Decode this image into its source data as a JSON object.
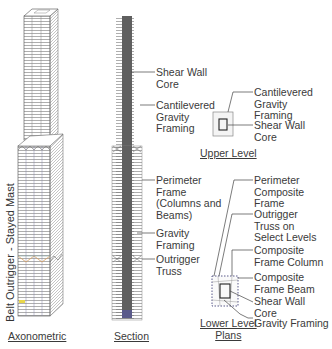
{
  "axonometric": {
    "caption": "Axonometric",
    "vertical_label": "Belt Outrigger - Stayed Mast"
  },
  "section": {
    "caption": "Section",
    "labels": {
      "shear_wall_core": "Shear Wall\nCore",
      "cantilevered_gravity": "Cantilevered\nGravity\nFraming",
      "perimeter_frame": "Perimeter\nFrame\n(Columns and\nBeams)",
      "gravity_framing": "Gravity\nFraming",
      "outrigger_truss": "Outrigger\nTruss"
    }
  },
  "upper_level": {
    "caption": "Upper Level",
    "labels": {
      "cantilevered_gravity": "Cantilevered\nGravity\nFraming",
      "shear_wall_core": "Shear Wall\nCore"
    }
  },
  "lower_level": {
    "caption": "Lower Level\nPlans",
    "labels": {
      "perimeter_composite": "Perimeter\nComposite\nFrame",
      "outrigger_truss_select": "Outrigger\nTruss on\nSelect Levels",
      "composite_column": "Composite\nFrame Column",
      "composite_beam": "Composite\nFrame Beam",
      "shear_wall_core": "Shear Wall\nCore",
      "gravity_framing": "Gravity Framing"
    }
  },
  "colors": {
    "core": "#5f5f5f",
    "line": "#555555",
    "leader": "#444444"
  }
}
